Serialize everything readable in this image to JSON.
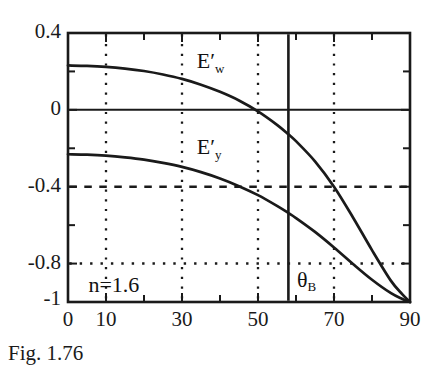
{
  "caption": "Fig. 1.76",
  "chart_data": {
    "type": "line",
    "title": "",
    "subtitle": "",
    "xlabel": "",
    "ylabel": "",
    "xlim": [
      0,
      90
    ],
    "ylim": [
      -1,
      0.4
    ],
    "grid": true,
    "legend_position": "inline-annotations",
    "x_ticks_major": [
      0,
      10,
      30,
      50,
      70,
      90
    ],
    "x_ticks_minor": [
      20,
      40,
      60,
      80
    ],
    "x_tick_labels": [
      "0",
      "10",
      "30",
      "50",
      "70",
      "90"
    ],
    "x_gridlines_dotted": [
      10,
      30,
      50,
      70
    ],
    "y_ticks_major": [
      0.4,
      0,
      -0.4,
      -0.8,
      -1
    ],
    "y_tick_labels": [
      "0.4",
      "0",
      "-0.4",
      "-0.8",
      "-1"
    ],
    "y_ticks_minor": [
      0.2,
      -0.2,
      -0.6
    ],
    "y_gridlines": [
      {
        "value": 0,
        "style": "solid"
      },
      {
        "value": -0.4,
        "style": "dashed"
      },
      {
        "value": -0.8,
        "style": "dotted"
      }
    ],
    "annotations": [
      {
        "name": "refractive-index",
        "text_prefix": "n",
        "text_eq": "=",
        "text_value": "1.6",
        "text": "n=1.6",
        "x": 8,
        "y": -0.92
      },
      {
        "name": "brewster-angle",
        "text": "θ",
        "subscript": "B",
        "x": 60,
        "y": -0.9
      },
      {
        "name": "brewster-line",
        "type": "vline",
        "x": 58,
        "style": "solid"
      }
    ],
    "series": [
      {
        "name": "E'w",
        "label_base": "E",
        "label_prime": "′",
        "label_sub": "w",
        "label_x": 36,
        "label_y": 0.25,
        "x": [
          0,
          5,
          10,
          15,
          20,
          25,
          30,
          35,
          40,
          45,
          50,
          55,
          58,
          60,
          65,
          70,
          75,
          80,
          85,
          88,
          90
        ],
        "values": [
          0.231,
          0.229,
          0.224,
          0.215,
          0.202,
          0.184,
          0.161,
          0.131,
          0.094,
          0.049,
          -0.008,
          -0.078,
          -0.127,
          -0.163,
          -0.268,
          -0.4,
          -0.56,
          -0.73,
          -0.89,
          -0.96,
          -1.0
        ]
      },
      {
        "name": "E'y",
        "label_base": "E",
        "label_prime": "′",
        "label_sub": "y",
        "label_x": 36,
        "label_y": -0.2,
        "x": [
          0,
          5,
          10,
          15,
          20,
          25,
          30,
          35,
          40,
          45,
          50,
          55,
          58,
          60,
          65,
          70,
          75,
          80,
          85,
          88,
          90
        ],
        "values": [
          -0.231,
          -0.233,
          -0.238,
          -0.247,
          -0.259,
          -0.276,
          -0.297,
          -0.324,
          -0.357,
          -0.397,
          -0.444,
          -0.5,
          -0.537,
          -0.563,
          -0.635,
          -0.716,
          -0.802,
          -0.884,
          -0.954,
          -0.984,
          -1.0
        ]
      }
    ]
  },
  "colors": {
    "axis": "#1a1a1a",
    "curve": "#1a1a1a",
    "grid": "#1a1a1a",
    "background": "#ffffff"
  }
}
